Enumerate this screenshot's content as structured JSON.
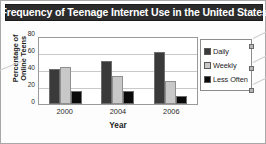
{
  "title": "Frequency of Teenage Internet Use in the United States",
  "axis": {
    "y_title_line1": "Percentage of",
    "y_title_line2": "Online Teens",
    "x_title": "Year"
  },
  "colors": {
    "title_bar": "#2b2b2b",
    "title_text": "#ffffff",
    "daily": "#3a3a3a",
    "weekly": "#c8c8c8",
    "less_often": "#0a0a0a",
    "gridline": "#c9c9c9",
    "plot_border": "#9a9a9a",
    "frame": "#a8a8a8"
  },
  "chart_data": {
    "type": "bar",
    "title": "Frequency of Teenage Internet Use in the United States",
    "xlabel": "Year",
    "ylabel": "Percentage of Online Teens",
    "categories": [
      "2000",
      "2004",
      "2006"
    ],
    "series": [
      {
        "name": "Daily",
        "color": "#3a3a3a",
        "values": [
          41,
          51,
          61
        ]
      },
      {
        "name": "Weekly",
        "color": "#c8c8c8",
        "values": [
          44,
          33,
          27
        ]
      },
      {
        "name": "Less Often",
        "color": "#0a0a0a",
        "values": [
          15,
          15,
          10
        ]
      }
    ],
    "ylim": [
      0,
      80
    ],
    "yticks": [
      0,
      20,
      40,
      60,
      80
    ],
    "ytick_labels": [
      "0",
      "20",
      "40",
      "60",
      "80"
    ],
    "grid": true,
    "grid_axis": "y",
    "legend_position": "right",
    "legend_entries": [
      "Daily",
      "Weekly",
      "Less Often"
    ]
  }
}
